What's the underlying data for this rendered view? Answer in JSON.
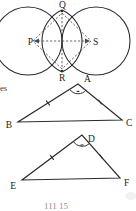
{
  "figure": {
    "caption_partial": "111 15",
    "margin_text": "es",
    "diagram_type": "geometry-construction",
    "colors": {
      "ink": "#2b2b2b",
      "dashed_ink": "#4a4a4a",
      "label_ink": "#1a1a1a",
      "faint_ink": "#8e8e8e",
      "background": "#ffffff"
    },
    "circles_construction": {
      "name": "two-intersecting-circles-rhombus",
      "labels": {
        "left_center": "P",
        "top_intersection": "Q",
        "bottom_intersection": "R",
        "right_center": "S"
      },
      "description": "Two equal overlapping circles centred at P and S intersecting at Q and R, with dashed rhombus PQSR and dashed diagonals QR and PS",
      "dashed_segments": [
        "PQ",
        "QS",
        "SR",
        "RP",
        "PS",
        "QR"
      ]
    },
    "triangle_1": {
      "name": "triangle-ABC",
      "vertices": {
        "apex": "A",
        "bottom_left": "B",
        "bottom_right": "C"
      },
      "marks": {
        "apex_angle_arc": true,
        "single_tick_sides": [
          "AB",
          "AC"
        ]
      }
    },
    "triangle_2": {
      "name": "triangle-DEF",
      "vertices": {
        "apex": "D",
        "bottom_left": "E",
        "bottom_right": "F"
      },
      "marks": {
        "apex_angle_arc": true,
        "single_tick_sides": [
          "DE",
          "DF"
        ]
      }
    }
  }
}
